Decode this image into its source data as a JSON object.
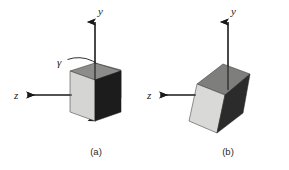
{
  "figure": {
    "background_color": "#ffffff",
    "stroke_color": "#1a1a1a",
    "panels": [
      {
        "id": "a",
        "caption": "(a)",
        "axes": [
          {
            "name": "y",
            "label": "y",
            "direction": "up"
          },
          {
            "name": "z",
            "label": "z",
            "direction": "left"
          }
        ],
        "rotation": {
          "label": "γ",
          "description": "rotation-arc-gamma",
          "direction": "clockwise-about-z"
        },
        "cube": {
          "orientation": "axis-aligned",
          "faces": [
            {
              "name": "left-face",
              "color": "#d5d5d3"
            },
            {
              "name": "top-face",
              "color": "#8c8c8a"
            },
            {
              "name": "right-face",
              "color": "#1c1c1c"
            }
          ]
        }
      },
      {
        "id": "b",
        "caption": "(b)",
        "axes": [
          {
            "name": "y",
            "label": "y",
            "direction": "up"
          },
          {
            "name": "z",
            "label": "z",
            "direction": "left"
          }
        ],
        "rotation": null,
        "cube": {
          "orientation": "rotated",
          "faces": [
            {
              "name": "left-face",
              "color": "#d9d9d7"
            },
            {
              "name": "top-face",
              "color": "#7e7e7c"
            },
            {
              "name": "right-face",
              "color": "#2b2b2b"
            }
          ]
        }
      }
    ]
  }
}
